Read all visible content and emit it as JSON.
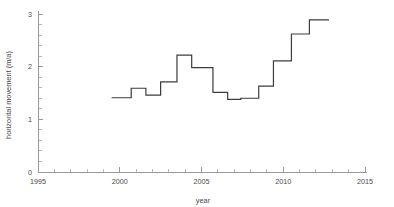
{
  "chart_data": {
    "type": "line",
    "line_style": "step-post",
    "title": "",
    "xlabel": "year",
    "ylabel": "horizontal movement (m/a)",
    "xlim": [
      1995,
      2015
    ],
    "ylim": [
      0,
      3
    ],
    "xticks": [
      1995,
      2000,
      2005,
      2010,
      2015
    ],
    "xtick_labels": [
      "1995",
      "2000",
      "2005",
      "2010",
      "2015"
    ],
    "yticks": [
      0,
      1,
      2,
      3
    ],
    "ytick_labels": [
      "0",
      "1",
      "2",
      "3"
    ],
    "x_minor_tick_interval": 1,
    "y_minor_tick_interval": 0.2,
    "grid": false,
    "legend": null,
    "series": [
      {
        "name": "horizontal movement",
        "color": "#3c3c3c",
        "x": [
          1999.5,
          2000.7,
          2001.6,
          2002.5,
          2003.5,
          2004.4,
          2005.7,
          2006.6,
          2007.4,
          2008.5,
          2009.4,
          2010.5,
          2011.6,
          2012.8
        ],
        "values": [
          1.41,
          1.59,
          1.46,
          1.71,
          2.22,
          1.98,
          1.51,
          1.38,
          1.4,
          1.63,
          2.11,
          2.62,
          2.89,
          2.89
        ],
        "segments": [
          {
            "x_start": 1999.5,
            "x_end": 2000.7,
            "value": 1.41
          },
          {
            "x_start": 2000.7,
            "x_end": 2001.6,
            "value": 1.59
          },
          {
            "x_start": 2001.6,
            "x_end": 2002.5,
            "value": 1.46
          },
          {
            "x_start": 2002.5,
            "x_end": 2003.5,
            "value": 1.71
          },
          {
            "x_start": 2003.5,
            "x_end": 2004.4,
            "value": 2.22
          },
          {
            "x_start": 2004.4,
            "x_end": 2005.7,
            "value": 1.98
          },
          {
            "x_start": 2005.7,
            "x_end": 2006.6,
            "value": 1.51
          },
          {
            "x_start": 2006.6,
            "x_end": 2007.4,
            "value": 1.38
          },
          {
            "x_start": 2007.4,
            "x_end": 2008.5,
            "value": 1.4
          },
          {
            "x_start": 2008.5,
            "x_end": 2009.4,
            "value": 1.63
          },
          {
            "x_start": 2009.4,
            "x_end": 2010.5,
            "value": 2.11
          },
          {
            "x_start": 2010.5,
            "x_end": 2011.6,
            "value": 2.62
          },
          {
            "x_start": 2011.6,
            "x_end": 2012.8,
            "value": 2.89
          }
        ]
      }
    ]
  }
}
